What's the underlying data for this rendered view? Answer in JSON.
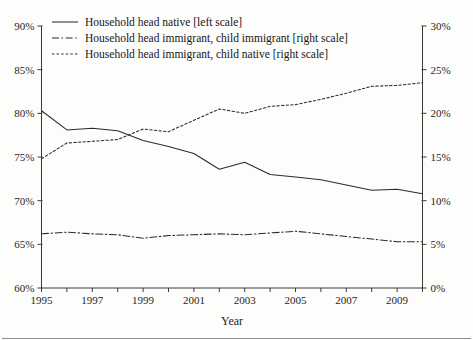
{
  "chart_data": {
    "type": "line",
    "title": "",
    "xlabel": "Year",
    "ylabel": "",
    "x": [
      1995,
      1996,
      1997,
      1998,
      1999,
      2000,
      2001,
      2002,
      2003,
      2004,
      2005,
      2006,
      2007,
      2008,
      2009,
      2010
    ],
    "xlim": [
      1995,
      2010
    ],
    "xticks": [
      1995,
      1997,
      1999,
      2001,
      2003,
      2005,
      2007,
      2009
    ],
    "xtick_labels": [
      "1995",
      "1997",
      "1999",
      "2001",
      "2003",
      "2005",
      "2007",
      "2009"
    ],
    "grid": false,
    "legend_position": "top-left",
    "left_axis": {
      "ylim": [
        60,
        90
      ],
      "ticks": [
        60,
        65,
        70,
        75,
        80,
        85,
        90
      ],
      "tick_labels": [
        "60%",
        "65%",
        "70%",
        "75%",
        "80%",
        "85%",
        "90%"
      ]
    },
    "right_axis": {
      "ylim": [
        0,
        30
      ],
      "ticks": [
        0,
        5,
        10,
        15,
        20,
        25,
        30
      ],
      "tick_labels": [
        "0%",
        "5%",
        "10%",
        "15%",
        "20%",
        "25%",
        "30%"
      ]
    },
    "series": [
      {
        "name": "Household head native [left scale]",
        "axis": "left",
        "style": "solid",
        "values": [
          80.3,
          78.1,
          78.3,
          78.0,
          76.9,
          76.2,
          75.4,
          73.6,
          74.4,
          73.0,
          72.7,
          72.4,
          71.8,
          71.2,
          71.3,
          70.8
        ]
      },
      {
        "name": "Household head immigrant, child immigrant [right scale]",
        "axis": "right",
        "style": "dash-dot",
        "values": [
          6.2,
          6.4,
          6.2,
          6.1,
          5.7,
          6.0,
          6.1,
          6.2,
          6.1,
          6.3,
          6.5,
          6.2,
          5.9,
          5.6,
          5.3,
          5.3
        ]
      },
      {
        "name": "Household head immigrant, child native [right scale]",
        "axis": "right",
        "style": "dotted",
        "values": [
          14.8,
          16.6,
          16.8,
          17.0,
          18.2,
          17.9,
          19.2,
          20.5,
          20.0,
          20.8,
          21.0,
          21.6,
          22.3,
          23.1,
          23.2,
          23.5
        ]
      }
    ]
  },
  "legend": {
    "items": [
      {
        "label": "Household head native [left scale]",
        "style": "solid"
      },
      {
        "label": "Household head immigrant, child immigrant [right scale]",
        "style": "dash-dot"
      },
      {
        "label": "Household head immigrant, child native [right scale]",
        "style": "dotted"
      }
    ]
  },
  "axis_titles": {
    "x": "Year"
  }
}
